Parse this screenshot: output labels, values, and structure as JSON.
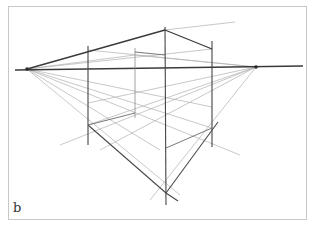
{
  "figure": {
    "panel_label": "b"
  },
  "colors": {
    "background": "#ffffff",
    "frame": "#c8c8c8",
    "strong_line": "#3a3a3a",
    "light_line": "#a8a8a8"
  }
}
